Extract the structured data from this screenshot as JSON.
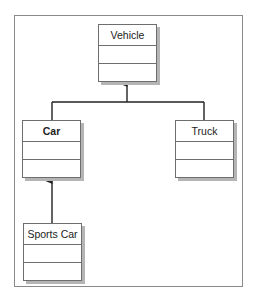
{
  "diagram": {
    "type": "uml-class-inheritance",
    "classes": [
      {
        "id": "vehicle",
        "name": "Vehicle",
        "bold": false
      },
      {
        "id": "car",
        "name": "Car",
        "bold": true
      },
      {
        "id": "truck",
        "name": "Truck",
        "bold": false
      },
      {
        "id": "sports_car",
        "name": "Sports Car",
        "bold": false
      }
    ],
    "relationships": [
      {
        "from": "Car",
        "to": "Vehicle",
        "kind": "inheritance"
      },
      {
        "from": "Truck",
        "to": "Vehicle",
        "kind": "inheritance"
      },
      {
        "from": "Sports Car",
        "to": "Car",
        "kind": "inheritance"
      }
    ],
    "colors": {
      "line": "#222222",
      "box_border": "#6e6e6e",
      "shadow": "#b5b5b5",
      "frame": "#8a8a8a"
    }
  }
}
